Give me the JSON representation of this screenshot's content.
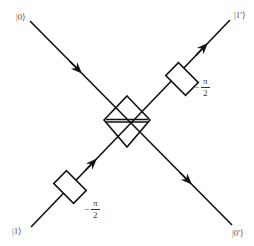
{
  "diagram": {
    "type": "Mach-Zehnder style beam splitter with phase shifters",
    "colors": {
      "line": "#111111",
      "label": "#555555",
      "background": "#ffffff"
    },
    "ports": {
      "input_top_left": "|0⟩",
      "input_bottom_left": "|1⟩",
      "output_top_right": "|1′⟩",
      "output_bottom_right": "|0′⟩"
    },
    "phase_shifters": [
      {
        "position": "lower-left arm",
        "sign": "−",
        "numerator": "π",
        "denominator": "2"
      },
      {
        "position": "upper-right arm",
        "sign": "−",
        "numerator": "π",
        "denominator": "2"
      }
    ],
    "center_element": "beam-splitter"
  }
}
